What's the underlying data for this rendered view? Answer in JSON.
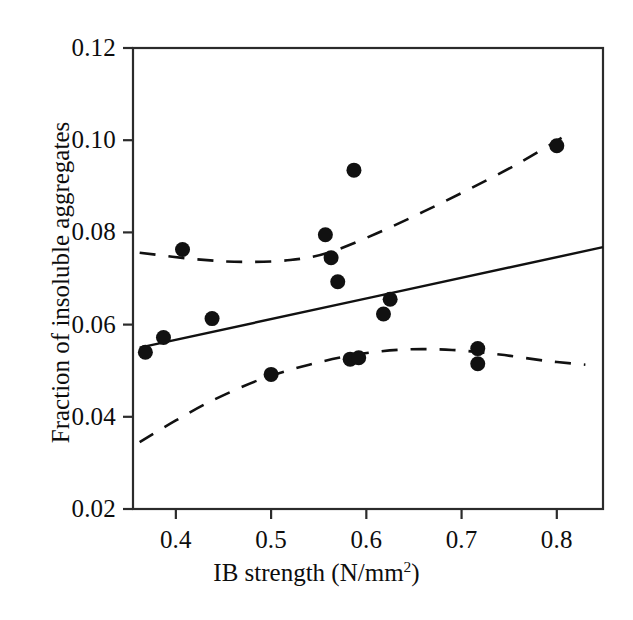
{
  "chart_data": {
    "type": "scatter",
    "title": "",
    "xlabel": "IB strength (N/mm2)",
    "xlabel_base": "IB strength (N/mm",
    "xlabel_sup": "2",
    "xlabel_tail": ")",
    "ylabel": "Fraction of insoluble aggregates",
    "xlim": [
      0.355,
      0.8485
    ],
    "ylim": [
      0.02,
      0.12
    ],
    "xticks": [
      0.4,
      0.5,
      0.6,
      0.7,
      0.8
    ],
    "xticklabels": [
      "0.4",
      "0.5",
      "0.6",
      "0.7",
      "0.8"
    ],
    "yticks": [
      0.02,
      0.04,
      0.06,
      0.08,
      0.1,
      0.12
    ],
    "yticklabels": [
      "0.02",
      "0.04",
      "0.06",
      "0.08",
      "0.10",
      "0.12"
    ],
    "grid": false,
    "legend": "none",
    "marker": "filled-circle",
    "marker_color": "#111111",
    "marker_size_px": 15,
    "points": [
      {
        "x": 0.368,
        "y": 0.054
      },
      {
        "x": 0.387,
        "y": 0.0572
      },
      {
        "x": 0.407,
        "y": 0.0763
      },
      {
        "x": 0.438,
        "y": 0.0613
      },
      {
        "x": 0.5,
        "y": 0.0492
      },
      {
        "x": 0.557,
        "y": 0.0795
      },
      {
        "x": 0.563,
        "y": 0.0745
      },
      {
        "x": 0.57,
        "y": 0.0693
      },
      {
        "x": 0.587,
        "y": 0.0935
      },
      {
        "x": 0.583,
        "y": 0.0525
      },
      {
        "x": 0.592,
        "y": 0.0528
      },
      {
        "x": 0.618,
        "y": 0.0623
      },
      {
        "x": 0.625,
        "y": 0.0655
      },
      {
        "x": 0.717,
        "y": 0.0548
      },
      {
        "x": 0.717,
        "y": 0.0515
      },
      {
        "x": 0.8,
        "y": 0.0988
      }
    ],
    "series": [
      {
        "name": "regression-line",
        "style": "solid",
        "color": "#111111",
        "points": [
          {
            "x": 0.362,
            "y": 0.055
          },
          {
            "x": 0.8485,
            "y": 0.0768
          }
        ]
      },
      {
        "name": "upper-confidence-band",
        "style": "dashed",
        "color": "#111111",
        "points": [
          {
            "x": 0.362,
            "y": 0.0756
          },
          {
            "x": 0.42,
            "y": 0.0742
          },
          {
            "x": 0.47,
            "y": 0.0736
          },
          {
            "x": 0.52,
            "y": 0.074
          },
          {
            "x": 0.56,
            "y": 0.0756
          },
          {
            "x": 0.61,
            "y": 0.0797
          },
          {
            "x": 0.66,
            "y": 0.0845
          },
          {
            "x": 0.71,
            "y": 0.0896
          },
          {
            "x": 0.76,
            "y": 0.095
          },
          {
            "x": 0.805,
            "y": 0.1005
          }
        ]
      },
      {
        "name": "lower-confidence-band",
        "style": "dashed",
        "color": "#111111",
        "points": [
          {
            "x": 0.362,
            "y": 0.0345
          },
          {
            "x": 0.4,
            "y": 0.0392
          },
          {
            "x": 0.44,
            "y": 0.0437
          },
          {
            "x": 0.49,
            "y": 0.0482
          },
          {
            "x": 0.54,
            "y": 0.0513
          },
          {
            "x": 0.59,
            "y": 0.0535
          },
          {
            "x": 0.64,
            "y": 0.0546
          },
          {
            "x": 0.69,
            "y": 0.0545
          },
          {
            "x": 0.74,
            "y": 0.0535
          },
          {
            "x": 0.79,
            "y": 0.0521
          },
          {
            "x": 0.83,
            "y": 0.0513
          }
        ]
      }
    ]
  },
  "axes": {
    "frame_color": "#2b2b2b",
    "background": "#ffffff"
  }
}
